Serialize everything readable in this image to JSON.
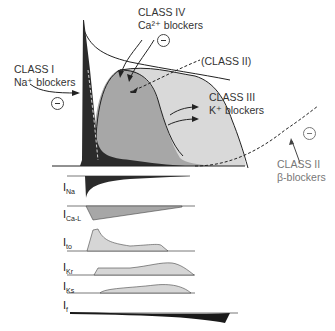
{
  "diagram": {
    "labels": {
      "class1_title": "CLASS I",
      "class1_sub": "Na⁺ blockers",
      "class4_title": "CLASS IV",
      "class4_sub": "Ca²⁺ blockers",
      "class2_paren": "(CLASS II)",
      "class3_title": "CLASS III",
      "class3_sub": "K⁺ blockers",
      "class2_title": "CLASS II",
      "class2_sub": "β-blockers"
    },
    "inhibit_symbol": "⊖",
    "currents": [
      {
        "main": "I",
        "sub": "Na"
      },
      {
        "main": "I",
        "sub": "Ca-L"
      },
      {
        "main": "I",
        "sub": "to"
      },
      {
        "main": "I",
        "sub": "Kr"
      },
      {
        "main": "I",
        "sub": "Ks"
      },
      {
        "main": "I",
        "sub": "f"
      }
    ],
    "colors": {
      "dark_fill": "#2b2b2b",
      "mid_fill": "#a9a9a9",
      "light_fill": "#d6d6d6",
      "line": "#222222",
      "gray_text": "#777777"
    }
  }
}
